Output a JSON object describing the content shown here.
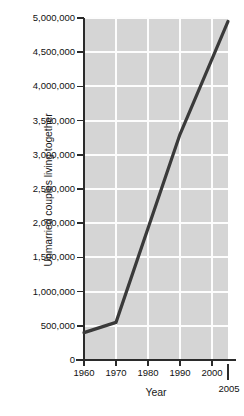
{
  "chart_data": {
    "type": "line",
    "title": "",
    "xlabel": "Year",
    "ylabel": "Unmarried couples living together",
    "xlim": [
      1960,
      2005
    ],
    "ylim": [
      0,
      5000000
    ],
    "grid": true,
    "legend": null,
    "x_tick_labels": [
      "1960",
      "1970",
      "1980",
      "1990",
      "2000",
      "2005"
    ],
    "x_ticks": [
      1960,
      1970,
      1980,
      1990,
      2000,
      2005
    ],
    "y_tick_labels": [
      "0",
      "500,000",
      "1,000,000",
      "1,500,000",
      "2,000,000",
      "2,500,000",
      "3,000,000",
      "3,500,000",
      "4,000,000",
      "4,500,000",
      "5,000,000"
    ],
    "y_ticks": [
      0,
      500000,
      1000000,
      1500000,
      2000000,
      2500000,
      3000000,
      3500000,
      4000000,
      4500000,
      5000000
    ],
    "series": [
      {
        "name": "Unmarried couples living together",
        "color": "#3a3a3a",
        "x": [
          1960,
          1970,
          1990,
          2005
        ],
        "values": [
          400000,
          550000,
          3300000,
          4950000
        ]
      }
    ],
    "plot_background": "#d5d5d5",
    "gridline_color": "#fdfdfd",
    "axis_color": "#2b2b2b"
  }
}
